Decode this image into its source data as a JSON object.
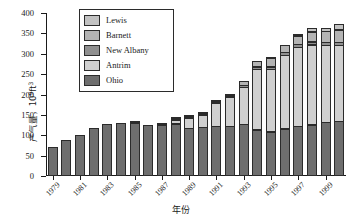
{
  "chart_data": {
    "type": "bar",
    "stacked": true,
    "title": "",
    "xlabel": "年份",
    "ylabel": "产气量，10⁹ft³",
    "ylim": [
      0,
      400
    ],
    "ytick_step": 50,
    "yticks": [
      0,
      50,
      100,
      150,
      200,
      250,
      300,
      350,
      400
    ],
    "grid": false,
    "legend_position": "top-left-inside",
    "categories": [
      "1979",
      "1980",
      "1981",
      "1982",
      "1983",
      "1984",
      "1985",
      "1986",
      "1987",
      "1988",
      "1989",
      "1990",
      "1991",
      "1992",
      "1993",
      "1994",
      "1995",
      "1996",
      "1997",
      "1998",
      "1999",
      "2000"
    ],
    "xtick_labels": [
      "1979",
      "1981",
      "1983",
      "1985",
      "1987",
      "1989",
      "1991",
      "1993",
      "1995",
      "1997",
      "1999"
    ],
    "series": [
      {
        "name": "Ohio",
        "color": "#6e6e6e",
        "values": [
          69,
          87,
          99,
          116,
          126,
          129,
          130,
          125,
          125,
          130,
          119,
          119,
          121,
          121,
          126,
          112,
          107,
          115,
          121,
          125,
          131,
          133
        ]
      },
      {
        "name": "Antrim",
        "color": "#d0d0d0",
        "values": [
          0,
          0,
          0,
          0,
          0,
          0,
          3,
          0,
          2,
          10,
          26,
          31,
          57,
          72,
          92,
          150,
          155,
          181,
          195,
          197,
          190,
          188
        ]
      },
      {
        "name": "New Albany",
        "color": "#8f8f8f",
        "values": [
          0,
          0,
          0,
          0,
          0,
          0,
          0,
          0,
          0,
          1,
          1,
          3,
          4,
          5,
          6,
          7,
          8,
          9,
          9,
          9,
          8,
          8
        ]
      },
      {
        "name": "Barnett",
        "color": "#b4b4b4",
        "values": [
          0,
          0,
          0,
          0,
          0,
          0,
          0,
          0,
          0,
          1,
          1,
          2,
          3,
          6,
          12,
          16,
          22,
          18,
          22,
          25,
          29,
          33
        ]
      },
      {
        "name": "Lewis",
        "color": "#c2c2c2",
        "values": [
          0,
          0,
          0,
          0,
          0,
          0,
          0,
          0,
          0,
          0,
          0,
          0,
          0,
          0,
          0,
          0,
          4,
          0,
          4,
          12,
          10,
          16
        ]
      }
    ],
    "legend_entries": [
      {
        "label": "Lewis",
        "color": "#c2c2c2"
      },
      {
        "label": "Barnett",
        "color": "#b4b4b4"
      },
      {
        "label": "New Albany",
        "color": "#8f8f8f"
      },
      {
        "label": "Antrim",
        "color": "#d0d0d0"
      },
      {
        "label": "Ohio",
        "color": "#6e6e6e"
      }
    ]
  }
}
